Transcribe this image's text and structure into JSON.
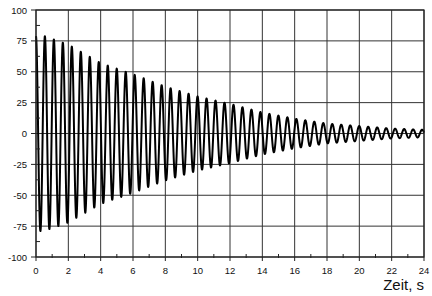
{
  "chart_data": {
    "type": "line",
    "title": "",
    "xlabel": "Zeit, s",
    "ylabel": "",
    "xlim": [
      0,
      24
    ],
    "ylim": [
      -100,
      100
    ],
    "grid": true,
    "legend": null,
    "x_ticks": [
      0,
      2,
      4,
      6,
      8,
      10,
      12,
      14,
      16,
      18,
      20,
      22,
      24
    ],
    "y_ticks": [
      100,
      75,
      50,
      25,
      0,
      -25,
      -50,
      -75,
      -100
    ],
    "series": [
      {
        "name": "damped oscillation",
        "description": "Damped sinusoidal oscillation, frequency ~1.8 Hz, amplitude decaying from ~80 to ~3",
        "frequency_hz": 1.8,
        "envelope": {
          "t": [
            0.5,
            2,
            4,
            6,
            8,
            10,
            12,
            14,
            16,
            18,
            20,
            22,
            24
          ],
          "amplitude": [
            79,
            72,
            57,
            48,
            38,
            30,
            24,
            17,
            12,
            8,
            6,
            4,
            3
          ]
        }
      }
    ]
  },
  "plot": {
    "line_color": "#000000",
    "grid_color": "#333333"
  }
}
